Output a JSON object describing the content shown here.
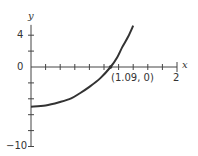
{
  "chart_data": {
    "type": "line",
    "title": "",
    "xlabel": "x",
    "ylabel": "y",
    "xlim": [
      0,
      2
    ],
    "ylim": [
      -10,
      5.5
    ],
    "x_ticks_step": 0.2,
    "y_ticks_step": 2,
    "x_tick_labels": [
      "2"
    ],
    "y_tick_labels": [
      "4",
      "0",
      "-10"
    ],
    "grid": false,
    "series": [
      {
        "name": "curve",
        "color": "#333333",
        "x": [
          0,
          0.2,
          0.4,
          0.55,
          0.67,
          0.8,
          0.95,
          1.09,
          1.18,
          1.25,
          1.33,
          1.4
        ],
        "y": [
          -5.0,
          -4.85,
          -4.4,
          -3.95,
          -3.3,
          -2.5,
          -1.4,
          0,
          1.2,
          2.5,
          3.8,
          5.2
        ]
      }
    ],
    "annotations": [
      {
        "text": "(1.09, 0)",
        "x": 1.09,
        "y": 0,
        "marker": "dot"
      }
    ]
  },
  "labels": {
    "x_axis": "x",
    "y_axis": "y",
    "y4": "4",
    "y0": "0",
    "yneg10": "−10",
    "x2": "2",
    "root": "(1.09, 0)"
  }
}
